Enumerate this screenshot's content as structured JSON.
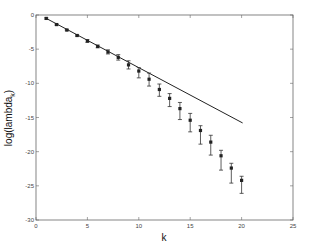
{
  "chart_data": {
    "type": "scatter",
    "title": "",
    "xlabel": "k",
    "ylabel": "log(lambda_k)",
    "ylabel_main": "log(lambda",
    "ylabel_sub": "k",
    "ylabel_close": ")",
    "xlim": [
      0,
      25
    ],
    "ylim": [
      -30,
      0
    ],
    "grid": false,
    "legend": null,
    "x_ticks": [
      0,
      5,
      10,
      15,
      20,
      25
    ],
    "y_ticks": [
      0,
      -5,
      -10,
      -15,
      -20,
      -25,
      -30
    ],
    "y_tick_labels": [
      "0",
      "-5",
      "-10",
      "-15",
      "-20",
      "-25",
      "-30"
    ],
    "series": [
      {
        "name": "observed (with error bars)",
        "kind": "errorbar",
        "x": [
          1,
          2,
          3,
          4,
          5,
          6,
          7,
          8,
          9,
          10,
          11,
          12,
          13,
          14,
          15,
          16,
          17,
          18,
          19,
          20
        ],
        "y": [
          -0.5,
          -1.4,
          -2.2,
          -3.0,
          -3.8,
          -4.6,
          -5.4,
          -6.2,
          -7.3,
          -8.2,
          -9.4,
          -10.9,
          -12.2,
          -13.7,
          -15.4,
          -16.9,
          -18.6,
          -20.6,
          -22.4,
          -24.2
        ],
        "y_upper": [
          -0.4,
          -1.3,
          -2.1,
          -2.9,
          -3.6,
          -4.4,
          -5.1,
          -5.8,
          -6.7,
          -7.7,
          -8.5,
          -10.1,
          -11.5,
          -12.8,
          -14.4,
          -16.2,
          -17.6,
          -19.8,
          -21.7,
          -23.6
        ],
        "y_lower": [
          -0.6,
          -1.5,
          -2.3,
          -3.1,
          -4.0,
          -4.8,
          -5.7,
          -6.6,
          -7.9,
          -9.2,
          -10.4,
          -11.9,
          -13.4,
          -15.3,
          -17.1,
          -18.9,
          -20.5,
          -22.7,
          -24.6,
          -26.1
        ]
      },
      {
        "name": "linear fit",
        "kind": "line",
        "x": [
          1,
          20.1
        ],
        "y": [
          -0.5,
          -15.8
        ]
      }
    ]
  }
}
